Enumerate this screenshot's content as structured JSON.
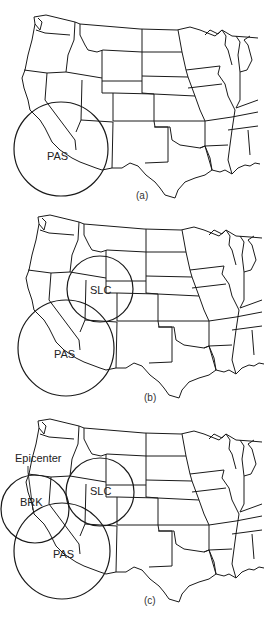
{
  "figure": {
    "panels": [
      {
        "id": "a",
        "caption": "(a)",
        "offset_y": 0,
        "caption_pos": [
          140,
          197
        ],
        "stations": [
          {
            "code": "PAS",
            "circle": {
              "cx": 61,
              "cy": 149,
              "r": 47
            },
            "label_pos": [
              47,
              160
            ]
          }
        ]
      },
      {
        "id": "b",
        "caption": "(b)",
        "offset_y": 200,
        "caption_pos": [
          150,
          399
        ],
        "stations": [
          {
            "code": "SLC",
            "circle": {
              "cx": 100,
              "cy": 289,
              "r": 33
            },
            "label_pos": [
              90,
              294
            ]
          },
          {
            "code": "PAS",
            "circle": {
              "cx": 66,
              "cy": 348,
              "r": 48
            },
            "label_pos": [
              54,
              358
            ]
          }
        ]
      },
      {
        "id": "c",
        "caption": "(c)",
        "offset_y": 404,
        "caption_pos": [
          150,
          602
        ],
        "stations": [
          {
            "code": "BRK",
            "circle": {
              "cx": 35,
              "cy": 509,
              "r": 34
            },
            "label_pos": [
              20,
              506
            ]
          },
          {
            "code": "SLC",
            "circle": {
              "cx": 100,
              "cy": 492,
              "r": 34
            },
            "label_pos": [
              90,
              495
            ]
          },
          {
            "code": "PAS",
            "circle": {
              "cx": 62,
              "cy": 551,
              "r": 48
            },
            "label_pos": [
              53,
              558
            ]
          }
        ],
        "annotation": {
          "text": "Epicenter",
          "pos": [
            15,
            462
          ]
        }
      }
    ]
  },
  "labels": {
    "a_caption": "(a)",
    "b_caption": "(b)",
    "c_caption": "(c)",
    "a_pas": "PAS",
    "b_slc": "SLC",
    "b_pas": "PAS",
    "c_brk": "BRK",
    "c_slc": "SLC",
    "c_pas": "PAS",
    "c_epicenter": "Epicenter"
  },
  "colors": {
    "line": "#1a1a1a",
    "background": "#ffffff"
  }
}
